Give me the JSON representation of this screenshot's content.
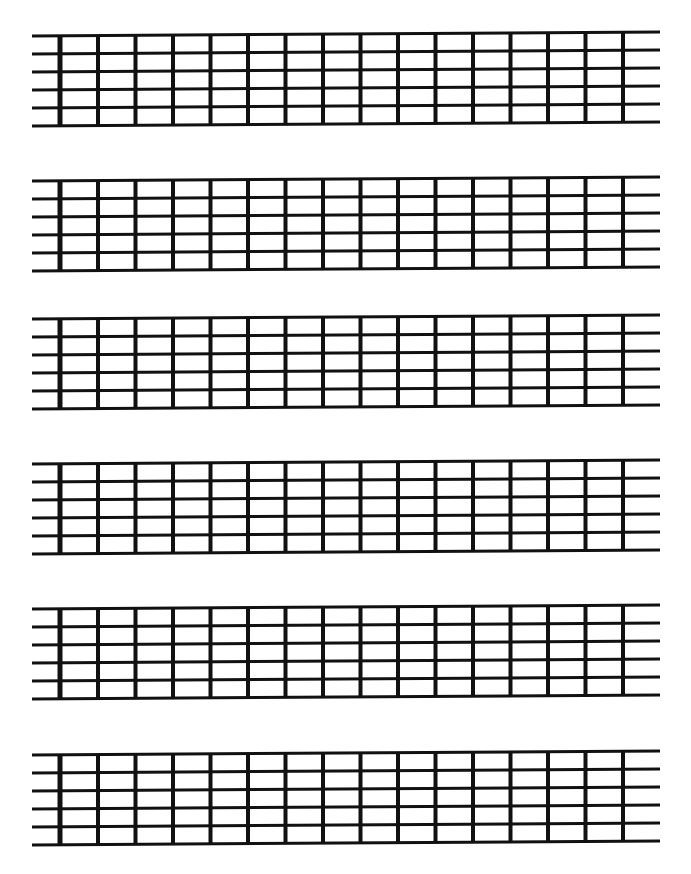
{
  "page": {
    "background_color": "#ffffff",
    "ink_color": "#111111",
    "width": 691,
    "height": 874
  },
  "diagram_template": {
    "type": "guitar-fretboard-grid",
    "string_count": 6,
    "fret_count": 15,
    "vertical_line_count": 16,
    "nut_label": "nut",
    "nut_x": 60,
    "nut_thickness": 5,
    "fret_thickness": 4,
    "string_thickness": 3,
    "first_fret_x": 98,
    "fret_spacing": 37.5,
    "last_fret_x": 622,
    "string_start_x": 32,
    "string_end_x": 660,
    "string_spacing": 18,
    "board_height": 90
  },
  "diagrams": [
    {
      "index": 1,
      "label": "fretboard-1",
      "top": 28,
      "skew_left_y": 2,
      "skew_right_y": -2
    },
    {
      "index": 2,
      "label": "fretboard-2",
      "top": 173,
      "skew_left_y": 2,
      "skew_right_y": -2
    },
    {
      "index": 3,
      "label": "fretboard-3",
      "top": 311,
      "skew_left_y": 2,
      "skew_right_y": -2
    },
    {
      "index": 4,
      "label": "fretboard-4",
      "top": 456,
      "skew_left_y": 2,
      "skew_right_y": -2
    },
    {
      "index": 5,
      "label": "fretboard-5",
      "top": 601,
      "skew_left_y": 2,
      "skew_right_y": -2
    },
    {
      "index": 6,
      "label": "fretboard-6",
      "top": 747,
      "skew_left_y": 2,
      "skew_right_y": -2
    }
  ],
  "chart_data": {
    "type": "table",
    "xlabel": "",
    "ylabel": "",
    "categories": [
      "fretboard-1",
      "fretboard-2",
      "fretboard-3",
      "fretboard-4",
      "fretboard-5",
      "fretboard-6"
    ],
    "values": [
      0,
      0,
      0,
      0,
      0,
      0
    ]
  }
}
